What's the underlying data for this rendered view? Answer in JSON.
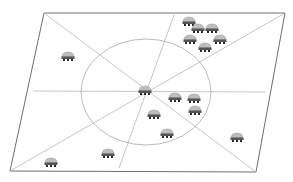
{
  "diagram": {
    "title": "",
    "colors": {
      "background": "#ffffff",
      "plane_border": "#6e6e6e",
      "guide_line": "#b8b8b8",
      "circle": "#a8a8a8",
      "robot_top": "#bdbdbd",
      "robot_body": "#555555",
      "robot_feet": "#2a2a2a"
    },
    "plane": {
      "points": [
        [
          44,
          13
        ],
        [
          285,
          13
        ],
        [
          256,
          172
        ],
        [
          10,
          171
        ]
      ]
    },
    "center": [
      146,
      92
    ],
    "circle": {
      "cx": 146,
      "cy": 92,
      "rx": 65,
      "ry": 53
    },
    "lines": [
      {
        "name": "horizontal-axis",
        "x1": 33,
        "y1": 91,
        "x2": 265,
        "y2": 92
      },
      {
        "name": "diagonal-tl-br",
        "x1": 44,
        "y1": 13,
        "x2": 256,
        "y2": 172
      },
      {
        "name": "diagonal-bl-tr",
        "x1": 10,
        "y1": 171,
        "x2": 285,
        "y2": 13
      },
      {
        "name": "vertical-axis",
        "x1": 174,
        "y1": 15,
        "x2": 119,
        "y2": 168
      }
    ],
    "robots": [
      {
        "id": "center",
        "x": 145,
        "y": 91
      },
      {
        "id": "r1",
        "x": 68,
        "y": 57
      },
      {
        "id": "r2",
        "x": 189,
        "y": 22
      },
      {
        "id": "r3",
        "x": 198,
        "y": 29
      },
      {
        "id": "r4",
        "x": 212,
        "y": 29
      },
      {
        "id": "r5",
        "x": 190,
        "y": 40
      },
      {
        "id": "r6",
        "x": 220,
        "y": 40
      },
      {
        "id": "r7",
        "x": 205,
        "y": 48
      },
      {
        "id": "r8",
        "x": 175,
        "y": 98
      },
      {
        "id": "r9",
        "x": 194,
        "y": 99
      },
      {
        "id": "r10",
        "x": 195,
        "y": 111
      },
      {
        "id": "r11",
        "x": 154,
        "y": 115
      },
      {
        "id": "r12",
        "x": 167,
        "y": 134
      },
      {
        "id": "r13",
        "x": 237,
        "y": 138
      },
      {
        "id": "r14",
        "x": 108,
        "y": 154
      },
      {
        "id": "r15",
        "x": 51,
        "y": 163
      }
    ]
  }
}
